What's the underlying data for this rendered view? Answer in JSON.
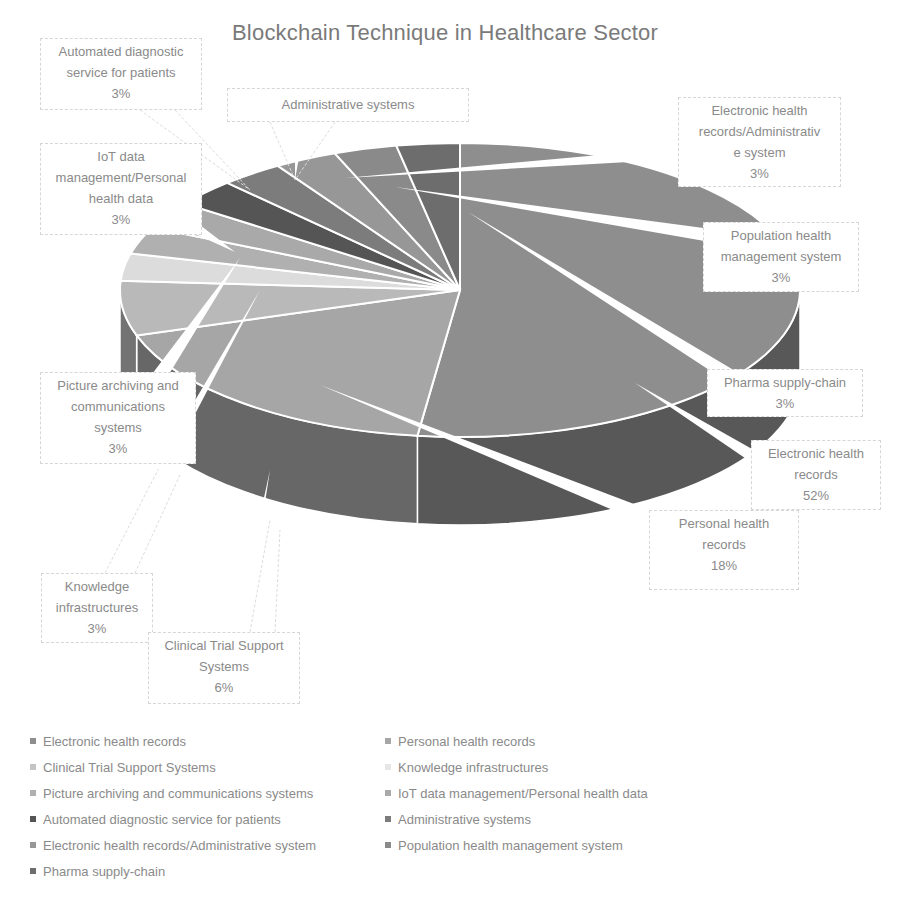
{
  "chart_data": {
    "type": "pie",
    "variant": "3d-exploded-leader-lines",
    "title": "Blockchain Technique in Healthcare Sector",
    "categories": [
      "Electronic health records",
      "Personal health records",
      "Clinical Trial Support Systems",
      "Knowledge infrastructures",
      "Picture archiving and communications systems",
      "IoT data management/Personal health data",
      "Automated diagnostic service for patients",
      "Administrative systems",
      "Electronic health records/Administrative system",
      "Population health management system",
      "Pharma supply-chain"
    ],
    "values": [
      52,
      18,
      6,
      3,
      3,
      3,
      3,
      3,
      3,
      3,
      3
    ],
    "unit": "%",
    "colors": [
      "#8e8e8e",
      "#a6a6a6",
      "#b9b9b9",
      "#dcdcdc",
      "#b0b0b0",
      "#a9a9a9",
      "#555555",
      "#7c7c7c",
      "#979797",
      "#8a8a8a",
      "#6d6d6d"
    ],
    "legend_position": "bottom",
    "grid": false
  },
  "labels": {
    "ehr": {
      "lines": [
        "Electronic health",
        "records"
      ],
      "pct": "52%"
    },
    "phr": {
      "lines": [
        "Personal health",
        "records"
      ],
      "pct": "18%"
    },
    "clinical": {
      "lines": [
        "Clinical Trial Support",
        "Systems"
      ],
      "pct": "6%"
    },
    "knowledge": {
      "lines": [
        "Knowledge",
        "infrastructures"
      ],
      "pct": "3%"
    },
    "pacs": {
      "lines": [
        "Picture archiving and",
        "communications",
        "systems"
      ],
      "pct": "3%"
    },
    "iot": {
      "lines": [
        "IoT data",
        "management/Personal",
        "health data"
      ],
      "pct": "3%"
    },
    "auto": {
      "lines": [
        "Automated diagnostic",
        "service for patients"
      ],
      "pct": "3%"
    },
    "admin": {
      "lines": [
        "Administrative systems"
      ],
      "pct": ""
    },
    "ehr_admin": {
      "lines": [
        "Electronic health",
        "records/Administrativ",
        "e system"
      ],
      "pct": "3%"
    },
    "population": {
      "lines": [
        "Population health",
        "management system"
      ],
      "pct": "3%"
    },
    "pharma": {
      "lines": [
        "Pharma supply-chain"
      ],
      "pct": "3%"
    }
  },
  "legend": [
    {
      "label": "Electronic health records",
      "color": "#8e8e8e"
    },
    {
      "label": "Personal health records",
      "color": "#a6a6a6"
    },
    {
      "label": "Clinical Trial Support Systems",
      "color": "#c4c4c4"
    },
    {
      "label": "Knowledge infrastructures",
      "color": "#e6e6e6"
    },
    {
      "label": "Picture archiving and communications systems",
      "color": "#b0b0b0"
    },
    {
      "label": "IoT data management/Personal health data",
      "color": "#a9a9a9"
    },
    {
      "label": "Automated diagnostic service for patients",
      "color": "#555555"
    },
    {
      "label": "Administrative systems",
      "color": "#7c7c7c"
    },
    {
      "label": "Electronic health records/Administrative system",
      "color": "#979797"
    },
    {
      "label": "Population health management system",
      "color": "#8a8a8a"
    },
    {
      "label": "Pharma supply-chain",
      "color": "#6d6d6d"
    }
  ]
}
